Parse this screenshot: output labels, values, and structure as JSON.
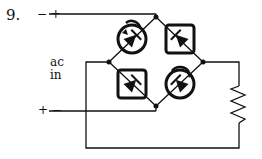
{
  "problem": {
    "number": "9."
  },
  "labels": {
    "top_terminal_polarity": "− +",
    "bottom_terminal_polarity": "+ −",
    "source_line1": "ac",
    "source_line2": "in"
  },
  "circuit": {
    "type": "full-wave bridge rectifier",
    "components": [
      {
        "id": "D1",
        "type": "diode",
        "position": "upper-left",
        "marking": "circle-with-arrow"
      },
      {
        "id": "D2",
        "type": "diode",
        "position": "upper-right",
        "marking": "square"
      },
      {
        "id": "D3",
        "type": "diode",
        "position": "lower-left",
        "marking": "square"
      },
      {
        "id": "D4",
        "type": "diode",
        "position": "lower-right",
        "marking": "circle-with-arrow"
      },
      {
        "id": "R",
        "type": "resistor",
        "position": "right",
        "role": "load"
      }
    ],
    "colors": {
      "stroke": "#111111",
      "background": "#ffffff"
    }
  }
}
